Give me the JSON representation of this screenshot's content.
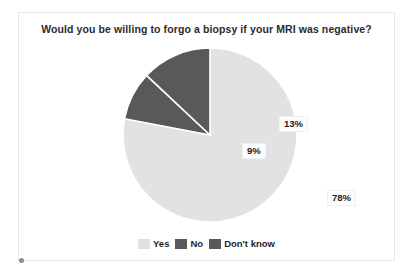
{
  "chart_data": {
    "type": "pie",
    "title": "Would you be willing to forgo a biopsy if your MRI was negative?",
    "categories": [
      "Yes",
      "No",
      "Don't know"
    ],
    "values": [
      78,
      9,
      13
    ],
    "value_labels": [
      "78%",
      "9%",
      "13%"
    ],
    "units": "percent",
    "colors": [
      "#e2e2e2",
      "#595959",
      "#595959"
    ],
    "legend_position": "bottom",
    "grid": false,
    "start_angle_deg": 0,
    "direction": "clockwise",
    "slices": [
      {
        "name": "Yes",
        "value": 78,
        "label": "78%",
        "color": "#e2e2e2"
      },
      {
        "name": "No",
        "value": 9,
        "label": "9%",
        "color": "#595959"
      },
      {
        "name": "Don't know",
        "value": 13,
        "label": "13%",
        "color": "#595959"
      }
    ]
  },
  "legend": {
    "items": [
      {
        "label": "Yes",
        "color": "#e2e2e2"
      },
      {
        "label": "No",
        "color": "#595959"
      },
      {
        "label": "Don't know",
        "color": "#595959"
      }
    ]
  },
  "colors": {
    "yes": "#e2e2e2",
    "no": "#595959",
    "dont_know": "#595959",
    "slice_separator": "#ffffff",
    "title_text": "#2b2b2b",
    "frame_border": "#e8e8e8",
    "background": "#ffffff"
  }
}
